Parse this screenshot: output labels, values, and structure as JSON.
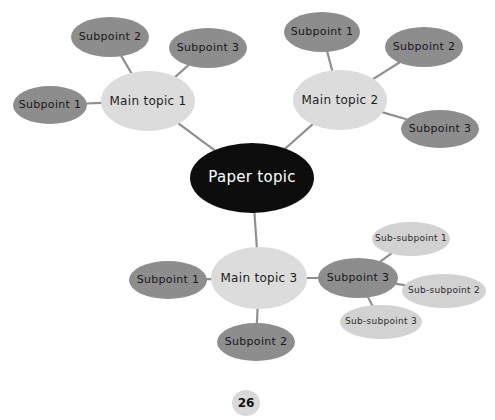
{
  "document": {
    "page_number": "26",
    "background_color": "#ffffff"
  },
  "diagram": {
    "type": "mind-map",
    "edge_color": "#8f8f8f",
    "palette": {
      "root": "#0d0d0d",
      "root_text": "#ffffff",
      "main_topic": "#dcdcdc",
      "subpoint": "#8d8d8d",
      "sub_subpoint": "#d2d2d2",
      "node_text": "#1c1c1c"
    },
    "root": {
      "label": "Paper topic",
      "cx": 252,
      "cy": 178,
      "rx": 62,
      "ry": 35
    },
    "branches": [
      {
        "main": {
          "label": "Main topic 1",
          "cx": 148,
          "cy": 101,
          "rx": 47,
          "ry": 30
        },
        "children": [
          {
            "label": "Subpoint 1",
            "cx": 50,
            "cy": 105,
            "rx": 37,
            "ry": 19
          },
          {
            "label": "Subpoint 2",
            "cx": 110,
            "cy": 37,
            "rx": 39,
            "ry": 20
          },
          {
            "label": "Subpoint 3",
            "cx": 208,
            "cy": 48,
            "rx": 39,
            "ry": 20
          }
        ]
      },
      {
        "main": {
          "label": "Main topic 2",
          "cx": 340,
          "cy": 100,
          "rx": 47,
          "ry": 30
        },
        "children": [
          {
            "label": "Subpoint 1",
            "cx": 322,
            "cy": 32,
            "rx": 38,
            "ry": 20
          },
          {
            "label": "Subpoint 2",
            "cx": 424,
            "cy": 47,
            "rx": 39,
            "ry": 20
          },
          {
            "label": "Subpoint 3",
            "cx": 440,
            "cy": 129,
            "rx": 39,
            "ry": 19
          }
        ]
      },
      {
        "main": {
          "label": "Main topic 3",
          "cx": 259,
          "cy": 278,
          "rx": 48,
          "ry": 31
        },
        "children": [
          {
            "label": "Subpoint 1",
            "cx": 168,
            "cy": 280,
            "rx": 39,
            "ry": 19
          },
          {
            "label": "Subpoint 2",
            "cx": 256,
            "cy": 342,
            "rx": 39,
            "ry": 19
          },
          {
            "label": "Subpoint 3",
            "cx": 358,
            "cy": 278,
            "rx": 40,
            "ry": 20,
            "children": [
              {
                "label": "Sub-subpoint 1",
                "cx": 411,
                "cy": 239,
                "rx": 39,
                "ry": 17
              },
              {
                "label": "Sub-subpoint 2",
                "cx": 444,
                "cy": 291,
                "rx": 42,
                "ry": 17
              },
              {
                "label": "Sub-subpoint 3",
                "cx": 381,
                "cy": 322,
                "rx": 41,
                "ry": 17
              }
            ]
          }
        ]
      }
    ]
  }
}
